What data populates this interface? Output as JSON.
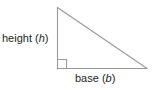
{
  "figure": {
    "name": "right-triangle-base-height-diagram",
    "background_color": "#ffffff",
    "stroke_color": "#9a9a9a",
    "text_color": "#231f20",
    "labels": {
      "height": {
        "text_prefix": "height (",
        "variable": "h",
        "text_suffix": ")",
        "full_text": "height (h)"
      },
      "base": {
        "text_prefix": "base (",
        "variable": "b",
        "text_suffix": ")",
        "full_text": "base (b)"
      }
    },
    "geometry": {
      "apex": [
        57,
        7
      ],
      "right_angle_vertex": [
        57,
        68
      ],
      "far_vertex": [
        147,
        68
      ],
      "right_angle_marker": {
        "x": 58,
        "y": 59,
        "size": 8
      }
    }
  }
}
